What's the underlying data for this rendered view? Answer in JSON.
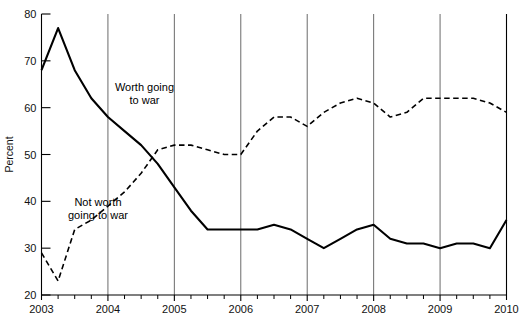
{
  "chart_data": {
    "type": "line",
    "title": "",
    "subtitle": "",
    "xlabel": "",
    "ylabel": "Percent",
    "xlim": [
      2003.0,
      2010.0
    ],
    "ylim": [
      20,
      80
    ],
    "yticks": [
      20,
      30,
      40,
      50,
      60,
      70,
      80
    ],
    "ytick_labels": [
      "20",
      "30",
      "40",
      "50",
      "60",
      "70",
      "80"
    ],
    "xticks": [
      2003,
      2004,
      2005,
      2006,
      2007,
      2008,
      2009,
      2010
    ],
    "xtick_labels": [
      "2003",
      "2004",
      "2005",
      "2006",
      "2007",
      "2008",
      "2009",
      "2010"
    ],
    "minor_xticks_per_year": 4,
    "grid": "vertical-only",
    "gridline_years": [
      2004,
      2005,
      2006,
      2007,
      2008,
      2009
    ],
    "legend": "inline-annotations",
    "annotations": [
      {
        "name": "worth-going-to-war-label",
        "text_line1": "Worth going",
        "text_line2": "to war",
        "x": 2004.55,
        "y": 63.5
      },
      {
        "name": "not-worth-going-to-war-label",
        "text_line1": "Not worth",
        "text_line2": "going to war",
        "x": 2003.85,
        "y": 39.0
      }
    ],
    "series": [
      {
        "name": "Worth going to war",
        "style": "solid",
        "color": "#000000",
        "width": 2.1,
        "x": [
          2003.0,
          2003.25,
          2003.5,
          2003.75,
          2004.0,
          2004.25,
          2004.5,
          2004.75,
          2005.0,
          2005.25,
          2005.5,
          2005.75,
          2006.0,
          2006.25,
          2006.5,
          2006.75,
          2007.0,
          2007.25,
          2007.5,
          2007.75,
          2008.0,
          2008.25,
          2008.5,
          2008.75,
          2009.0,
          2009.25,
          2009.5,
          2009.75,
          2010.0
        ],
        "values": [
          68,
          77,
          68,
          62,
          58,
          55,
          52,
          48,
          43,
          38,
          34,
          34,
          34,
          34,
          35,
          34,
          32,
          30,
          32,
          34,
          35,
          32,
          31,
          31,
          30,
          31,
          31,
          30,
          36
        ]
      },
      {
        "name": "Not worth going to war",
        "style": "dashed",
        "color": "#000000",
        "width": 1.6,
        "x": [
          2003.0,
          2003.25,
          2003.5,
          2003.75,
          2004.0,
          2004.25,
          2004.5,
          2004.75,
          2005.0,
          2005.25,
          2005.5,
          2005.75,
          2006.0,
          2006.25,
          2006.5,
          2006.75,
          2007.0,
          2007.25,
          2007.5,
          2007.75,
          2008.0,
          2008.25,
          2008.5,
          2008.75,
          2009.0,
          2009.25,
          2009.5,
          2009.75,
          2010.0
        ],
        "values": [
          29,
          23,
          34,
          36,
          39,
          42,
          46,
          51,
          52,
          52,
          51,
          50,
          50,
          55,
          58,
          58,
          56,
          59,
          61,
          62,
          61,
          58,
          59,
          62,
          62,
          62,
          62,
          61,
          59
        ]
      }
    ]
  },
  "axis": {
    "y_title": "Percent"
  },
  "colors": {
    "line": "#000000",
    "gridline": "#6b6b6b",
    "axis": "#000000",
    "background": "#ffffff"
  }
}
